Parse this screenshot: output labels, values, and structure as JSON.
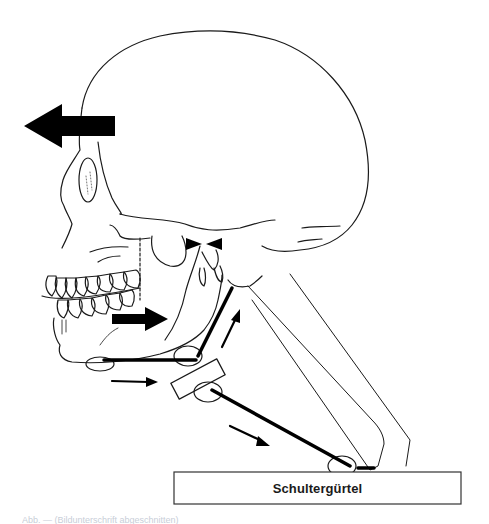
{
  "figure": {
    "type": "anatomical-diagram",
    "colors": {
      "line": "#1a1a1a",
      "fill": "#ffffff",
      "arrow": "#000000",
      "caption": "#c8ced8"
    },
    "labels": {
      "shoulder_girdle": "Schultergürtel"
    },
    "arrows": [
      {
        "name": "head-forward-arrow",
        "direction": "left",
        "size": "large"
      },
      {
        "name": "mandible-retrusion-arrow",
        "direction": "right",
        "size": "medium"
      },
      {
        "name": "suprahyoid-pull-arrow",
        "direction": "right",
        "size": "small"
      },
      {
        "name": "infrahyoid-pull-arrow",
        "direction": "down-right",
        "size": "small"
      },
      {
        "name": "hyoid-up-arrow",
        "direction": "up-right",
        "size": "small"
      }
    ],
    "caption": "Abb. — (Bildunterschrift abgeschnitten)"
  }
}
